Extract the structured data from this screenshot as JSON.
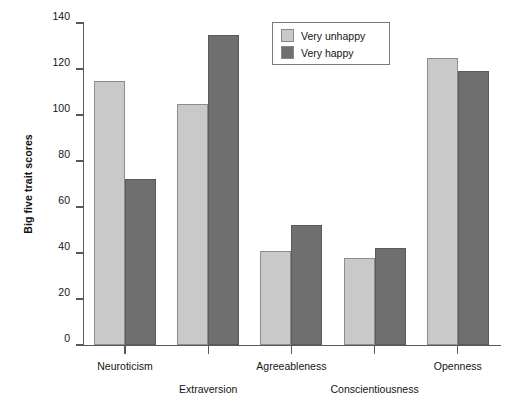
{
  "chart_data": {
    "type": "bar",
    "title": "",
    "subtitle": "",
    "xlabel": "",
    "ylabel": "Big five trait scores",
    "categories": [
      "Neuroticism",
      "Extraversion",
      "Agreeableness",
      "Conscientiousness",
      "Openness"
    ],
    "series": [
      {
        "name": "Very unhappy",
        "color": "#c9c9c9",
        "values": [
          115,
          105,
          41,
          38,
          125
        ]
      },
      {
        "name": "Very happy",
        "color": "#6f6f6f",
        "values": [
          72,
          135,
          52,
          42,
          119
        ]
      }
    ],
    "ylim": [
      0,
      140
    ],
    "ytick_values": [
      0,
      20,
      40,
      60,
      80,
      100,
      120,
      140
    ],
    "ytick_labels": [
      "0",
      "20",
      "40",
      "60",
      "80",
      "100",
      "120",
      "140"
    ],
    "grid": false,
    "legend_position": "top-center-right",
    "category_label_rows": [
      0,
      1,
      0,
      1,
      0
    ]
  },
  "legend": {
    "entries": [
      {
        "label": "Very unhappy"
      },
      {
        "label": "Very happy"
      }
    ]
  },
  "axes": {
    "y_title": "Big five trait scores"
  }
}
